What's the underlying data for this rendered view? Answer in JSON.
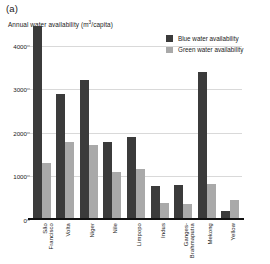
{
  "panel": {
    "label": "(a)"
  },
  "legend": {
    "position": "top-right",
    "items": [
      {
        "label": "Blue water availability",
        "color": "#3b3b3b",
        "key": "blue"
      },
      {
        "label": "Green water availability",
        "color": "#a9a9a9",
        "key": "green"
      }
    ]
  },
  "axis": {
    "title_main": "Annual water availability (m",
    "title_sup": "3",
    "title_tail": "/capita)",
    "yticks": [
      "0",
      "1000",
      "2000",
      "3000",
      "4000"
    ]
  },
  "chart_data": {
    "type": "bar",
    "title": "Annual water availability (m3/capita)",
    "xlabel": "",
    "ylabel": "Annual water availability (m3/capita)",
    "ylim": [
      0,
      4500
    ],
    "yticks": [
      0,
      1000,
      2000,
      3000,
      4000
    ],
    "grid": true,
    "legend_position": "top-right",
    "categories": [
      "São Francisco",
      "Volta",
      "Niger",
      "Nile",
      "Limpopo",
      "Indus",
      "Ganges-Brahmaputra",
      "Mekong",
      "Yellow"
    ],
    "category_lines": [
      [
        "São",
        "Francisco"
      ],
      [
        "Volta",
        ""
      ],
      [
        "Niger",
        ""
      ],
      [
        "Nile",
        ""
      ],
      [
        "Limpopo",
        ""
      ],
      [
        "Indus",
        ""
      ],
      [
        "Ganges-",
        "Brahmaputra"
      ],
      [
        "Mekong",
        ""
      ],
      [
        "Yellow",
        ""
      ]
    ],
    "series": [
      {
        "name": "Blue water availability",
        "color": "#3b3b3b",
        "values": [
          4450,
          2900,
          3220,
          1780,
          1900,
          770,
          800,
          3400,
          200
        ]
      },
      {
        "name": "Green water availability",
        "color": "#a9a9a9",
        "values": [
          1320,
          1800,
          1720,
          1110,
          1180,
          400,
          370,
          830,
          450
        ]
      }
    ]
  }
}
